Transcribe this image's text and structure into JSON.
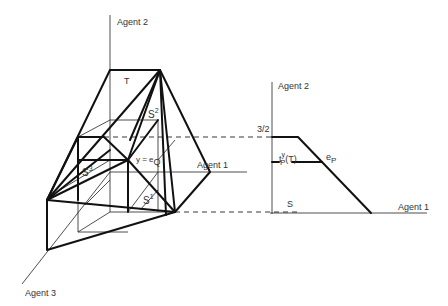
{
  "left_diagram": {
    "axis_labels": {
      "agent2": "Agent 2",
      "agent1": "Agent 1",
      "agent3": "Agent 3"
    },
    "region_labels": {
      "T": "T",
      "S1_base": "S",
      "S1_sup": "1",
      "S2_base": "S",
      "S2_sup": "2",
      "S3_base": "S",
      "S3_sup": "3",
      "center_eq": "y = e",
      "center_sub": "Q"
    }
  },
  "right_diagram": {
    "axis_labels": {
      "agent2": "Agent 2",
      "agent1": "Agent 1"
    },
    "tick_label": "3/2",
    "region_labels": {
      "S": "S",
      "t_base": "t",
      "t_sup": "y",
      "t_sub": "P",
      "t_arg": "(T)",
      "e_base": "e",
      "e_sub": "P"
    }
  }
}
